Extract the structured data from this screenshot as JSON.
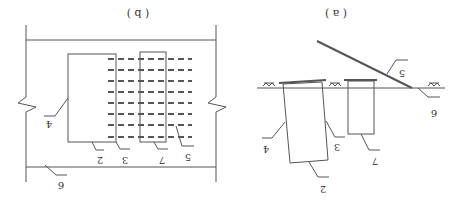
{
  "figure": {
    "orientation": "rotated-180",
    "panels": [
      {
        "id": "b",
        "caption": "( b )",
        "view": "plan",
        "labels": {
          "guide_wall": "4",
          "panel_bottom": "2",
          "panel_edge": "3",
          "pile": "7",
          "anchor": "5",
          "ground": "6"
        },
        "dashed_rows": 8
      },
      {
        "id": "a",
        "caption": "( a )",
        "view": "section",
        "labels": {
          "panel_side": "4",
          "panel_bottom": "2",
          "panel_edge": "3",
          "pile": "7",
          "anchor": "5",
          "ground": "6"
        },
        "ground_symbol": "⏄⏄"
      }
    ]
  },
  "colors": {
    "stroke": "#555555",
    "text": "#333333",
    "background": "#ffffff"
  }
}
